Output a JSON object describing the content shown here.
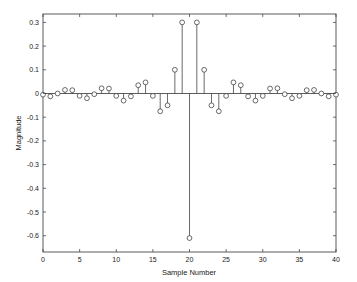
{
  "chart_data": {
    "type": "stem",
    "title": "",
    "xlabel": "Sample Number",
    "ylabel": "Magnitude",
    "xlim": [
      0,
      40
    ],
    "ylim": [
      -0.65,
      0.33
    ],
    "xticks": [
      0,
      5,
      10,
      15,
      20,
      25,
      30,
      35,
      40
    ],
    "yticks": [
      -0.6,
      -0.5,
      -0.4,
      -0.3,
      -0.2,
      -0.1,
      0,
      0.1,
      0.2,
      0.3
    ],
    "ytick_labels": [
      "-0.6",
      "-0.5",
      "-0.4",
      "-0.3",
      "-0.2",
      "-0.1",
      "0",
      "0.1",
      "0.2",
      "0.3"
    ],
    "grid": false,
    "legend": null,
    "marker": "open-circle",
    "x": [
      0,
      1,
      2,
      3,
      4,
      5,
      6,
      7,
      8,
      9,
      10,
      11,
      12,
      13,
      14,
      15,
      16,
      17,
      18,
      19,
      20,
      21,
      22,
      23,
      24,
      25,
      26,
      27,
      28,
      29,
      30,
      31,
      32,
      33,
      34,
      35,
      36,
      37,
      38,
      39,
      40
    ],
    "values": [
      -0.005,
      -0.012,
      0.0,
      0.015,
      0.014,
      -0.01,
      -0.02,
      -0.003,
      0.022,
      0.021,
      -0.01,
      -0.03,
      -0.012,
      0.035,
      0.047,
      -0.01,
      -0.075,
      -0.05,
      0.1,
      0.3,
      -0.61,
      0.3,
      0.1,
      -0.05,
      -0.075,
      -0.01,
      0.047,
      0.035,
      -0.012,
      -0.03,
      -0.01,
      0.021,
      0.022,
      -0.003,
      -0.02,
      -0.01,
      0.014,
      0.015,
      0.0,
      -0.012,
      -0.005
    ]
  },
  "colors": {
    "axes": "#333333",
    "stem": "#444444",
    "background": "#ffffff"
  }
}
